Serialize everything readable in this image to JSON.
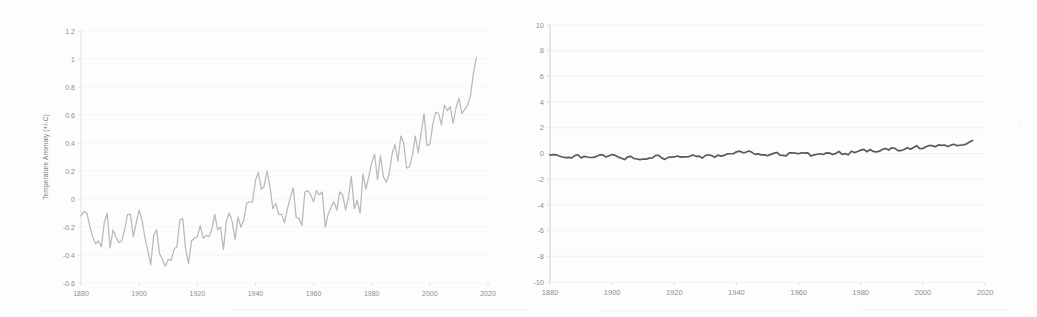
{
  "figure": {
    "background_color": "#fdfdfd",
    "panel_count": 2
  },
  "left_panel": {
    "ylabel": "Temperature Anomaly (+/-C)",
    "y_ticks": [
      "1.2",
      "1",
      "0.8",
      "0.6",
      "0.4",
      "0.2",
      "0",
      "-0.2",
      "-0.4",
      "-0.6"
    ],
    "x_ticks": [
      "1880",
      "1900",
      "1920",
      "1940",
      "1960",
      "1980",
      "2000",
      "2020"
    ],
    "line_color": "#b9b9b9",
    "grid_color": "#f1f1f1"
  },
  "right_panel": {
    "ylabel": "",
    "y_ticks": [
      "10",
      "8",
      "6",
      "4",
      "2",
      "0",
      "-2",
      "-4",
      "-6",
      "-8",
      "-10"
    ],
    "x_ticks": [
      "1880",
      "1900",
      "1920",
      "1940",
      "1960",
      "1980",
      "2000",
      "2020"
    ],
    "line_color": "#5a5a5a",
    "grid_color": "#eeeeee"
  },
  "chart_data": [
    {
      "type": "line",
      "title": "",
      "xlabel": "",
      "ylabel": "Temperature Anomaly (+/-C)",
      "xlim": [
        1880,
        2020
      ],
      "ylim": [
        -0.6,
        1.2
      ],
      "ytick_step": 0.2,
      "xtick_step": 20,
      "grid": true,
      "legend": "none",
      "line_color": "#b9b9b9",
      "series": [
        {
          "name": "Global land-ocean temperature anomaly",
          "x": [
            1880,
            1881,
            1882,
            1883,
            1884,
            1885,
            1886,
            1887,
            1888,
            1889,
            1890,
            1891,
            1892,
            1893,
            1894,
            1895,
            1896,
            1897,
            1898,
            1899,
            1900,
            1901,
            1902,
            1903,
            1904,
            1905,
            1906,
            1907,
            1908,
            1909,
            1910,
            1911,
            1912,
            1913,
            1914,
            1915,
            1916,
            1917,
            1918,
            1919,
            1920,
            1921,
            1922,
            1923,
            1924,
            1925,
            1926,
            1927,
            1928,
            1929,
            1930,
            1931,
            1932,
            1933,
            1934,
            1935,
            1936,
            1937,
            1938,
            1939,
            1940,
            1941,
            1942,
            1943,
            1944,
            1945,
            1946,
            1947,
            1948,
            1949,
            1950,
            1951,
            1952,
            1953,
            1954,
            1955,
            1956,
            1957,
            1958,
            1959,
            1960,
            1961,
            1962,
            1963,
            1964,
            1965,
            1966,
            1967,
            1968,
            1969,
            1970,
            1971,
            1972,
            1973,
            1974,
            1975,
            1976,
            1977,
            1978,
            1979,
            1980,
            1981,
            1982,
            1983,
            1984,
            1985,
            1986,
            1987,
            1988,
            1989,
            1990,
            1991,
            1992,
            1993,
            1994,
            1995,
            1996,
            1997,
            1998,
            1999,
            2000,
            2001,
            2002,
            2003,
            2004,
            2005,
            2006,
            2007,
            2008,
            2009,
            2010,
            2011,
            2012,
            2013,
            2014,
            2015,
            2016
          ],
          "y": [
            -0.12,
            -0.09,
            -0.1,
            -0.19,
            -0.27,
            -0.32,
            -0.3,
            -0.34,
            -0.17,
            -0.1,
            -0.35,
            -0.22,
            -0.27,
            -0.31,
            -0.3,
            -0.22,
            -0.11,
            -0.11,
            -0.27,
            -0.17,
            -0.08,
            -0.15,
            -0.28,
            -0.37,
            -0.47,
            -0.26,
            -0.22,
            -0.39,
            -0.43,
            -0.48,
            -0.43,
            -0.44,
            -0.36,
            -0.34,
            -0.15,
            -0.14,
            -0.36,
            -0.46,
            -0.3,
            -0.28,
            -0.27,
            -0.19,
            -0.28,
            -0.26,
            -0.27,
            -0.22,
            -0.11,
            -0.22,
            -0.2,
            -0.36,
            -0.16,
            -0.1,
            -0.16,
            -0.29,
            -0.13,
            -0.2,
            -0.15,
            -0.03,
            -0.02,
            -0.02,
            0.13,
            0.19,
            0.07,
            0.09,
            0.2,
            0.09,
            -0.07,
            -0.03,
            -0.11,
            -0.11,
            -0.17,
            -0.07,
            0.01,
            0.08,
            -0.13,
            -0.14,
            -0.19,
            0.05,
            0.06,
            0.03,
            -0.02,
            0.06,
            0.03,
            0.05,
            -0.2,
            -0.11,
            -0.06,
            -0.02,
            -0.08,
            0.05,
            0.03,
            -0.08,
            0.01,
            0.16,
            -0.07,
            -0.01,
            -0.1,
            0.18,
            0.07,
            0.16,
            0.26,
            0.32,
            0.14,
            0.31,
            0.16,
            0.12,
            0.18,
            0.32,
            0.39,
            0.27,
            0.45,
            0.4,
            0.22,
            0.23,
            0.31,
            0.45,
            0.33,
            0.47,
            0.61,
            0.38,
            0.39,
            0.53,
            0.62,
            0.61,
            0.53,
            0.67,
            0.63,
            0.66,
            0.54,
            0.65,
            0.72,
            0.61,
            0.64,
            0.67,
            0.74,
            0.9,
            1.01
          ]
        }
      ]
    },
    {
      "type": "line",
      "title": "",
      "xlabel": "",
      "ylabel": "",
      "xlim": [
        1880,
        2020
      ],
      "ylim": [
        -10,
        10
      ],
      "ytick_step": 2,
      "xtick_step": 20,
      "grid": true,
      "legend": "none",
      "line_color": "#5a5a5a",
      "series": [
        {
          "name": "Global land-ocean temperature anomaly (wide y-scale)",
          "x": [
            1880,
            1881,
            1882,
            1883,
            1884,
            1885,
            1886,
            1887,
            1888,
            1889,
            1890,
            1891,
            1892,
            1893,
            1894,
            1895,
            1896,
            1897,
            1898,
            1899,
            1900,
            1901,
            1902,
            1903,
            1904,
            1905,
            1906,
            1907,
            1908,
            1909,
            1910,
            1911,
            1912,
            1913,
            1914,
            1915,
            1916,
            1917,
            1918,
            1919,
            1920,
            1921,
            1922,
            1923,
            1924,
            1925,
            1926,
            1927,
            1928,
            1929,
            1930,
            1931,
            1932,
            1933,
            1934,
            1935,
            1936,
            1937,
            1938,
            1939,
            1940,
            1941,
            1942,
            1943,
            1944,
            1945,
            1946,
            1947,
            1948,
            1949,
            1950,
            1951,
            1952,
            1953,
            1954,
            1955,
            1956,
            1957,
            1958,
            1959,
            1960,
            1961,
            1962,
            1963,
            1964,
            1965,
            1966,
            1967,
            1968,
            1969,
            1970,
            1971,
            1972,
            1973,
            1974,
            1975,
            1976,
            1977,
            1978,
            1979,
            1980,
            1981,
            1982,
            1983,
            1984,
            1985,
            1986,
            1987,
            1988,
            1989,
            1990,
            1991,
            1992,
            1993,
            1994,
            1995,
            1996,
            1997,
            1998,
            1999,
            2000,
            2001,
            2002,
            2003,
            2004,
            2005,
            2006,
            2007,
            2008,
            2009,
            2010,
            2011,
            2012,
            2013,
            2014,
            2015,
            2016
          ],
          "y": [
            -0.12,
            -0.09,
            -0.1,
            -0.19,
            -0.27,
            -0.32,
            -0.3,
            -0.34,
            -0.17,
            -0.1,
            -0.35,
            -0.22,
            -0.27,
            -0.31,
            -0.3,
            -0.22,
            -0.11,
            -0.11,
            -0.27,
            -0.17,
            -0.08,
            -0.15,
            -0.28,
            -0.37,
            -0.47,
            -0.26,
            -0.22,
            -0.39,
            -0.43,
            -0.48,
            -0.43,
            -0.44,
            -0.36,
            -0.34,
            -0.15,
            -0.14,
            -0.36,
            -0.46,
            -0.3,
            -0.28,
            -0.27,
            -0.19,
            -0.28,
            -0.26,
            -0.27,
            -0.22,
            -0.11,
            -0.22,
            -0.2,
            -0.36,
            -0.16,
            -0.1,
            -0.16,
            -0.29,
            -0.13,
            -0.2,
            -0.15,
            -0.03,
            -0.02,
            -0.02,
            0.13,
            0.19,
            0.07,
            0.09,
            0.2,
            0.09,
            -0.07,
            -0.03,
            -0.11,
            -0.11,
            -0.17,
            -0.07,
            0.01,
            0.08,
            -0.13,
            -0.14,
            -0.19,
            0.05,
            0.06,
            0.03,
            -0.02,
            0.06,
            0.03,
            0.05,
            -0.2,
            -0.11,
            -0.06,
            -0.02,
            -0.08,
            0.05,
            0.03,
            -0.08,
            0.01,
            0.16,
            -0.07,
            -0.01,
            -0.1,
            0.18,
            0.07,
            0.16,
            0.26,
            0.32,
            0.14,
            0.31,
            0.16,
            0.12,
            0.18,
            0.32,
            0.39,
            0.27,
            0.45,
            0.4,
            0.22,
            0.23,
            0.31,
            0.45,
            0.33,
            0.47,
            0.61,
            0.38,
            0.39,
            0.53,
            0.62,
            0.61,
            0.53,
            0.67,
            0.63,
            0.66,
            0.54,
            0.65,
            0.72,
            0.61,
            0.64,
            0.67,
            0.74,
            0.9,
            1.01
          ]
        }
      ]
    }
  ]
}
